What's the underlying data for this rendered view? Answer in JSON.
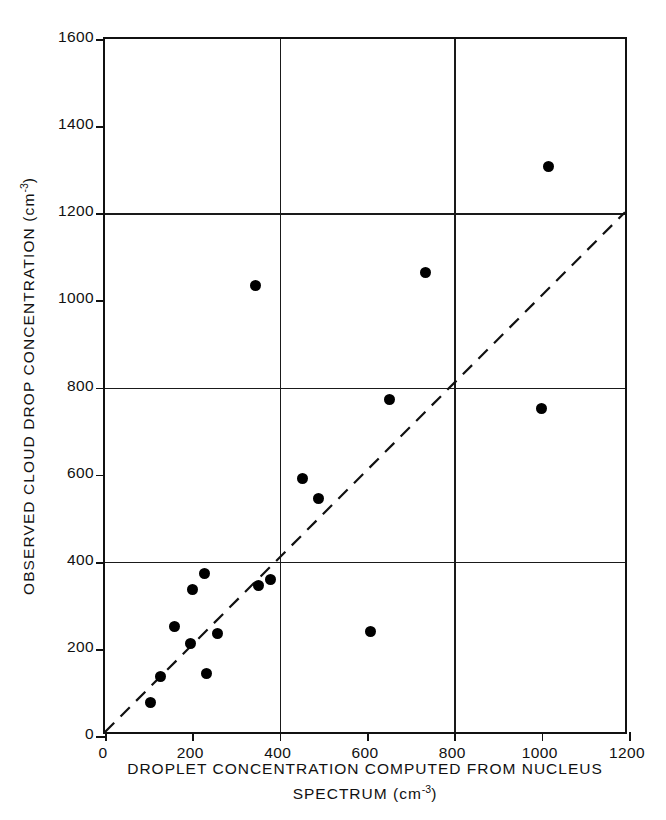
{
  "chart_data": {
    "type": "scatter",
    "title": "",
    "xlabel": "DROPLET CONCENTRATION COMPUTED FROM NUCLEUS SPECTRUM (cm-3)",
    "xlabel_line1": "DROPLET CONCENTRATION COMPUTED FROM NUCLEUS",
    "xlabel_line2_prefix": "SPECTRUM (cm",
    "xlabel_line2_exp": "-3",
    "xlabel_line2_suffix": ")",
    "ylabel": "OBSERVED CLOUD DROP CONCENTRATION (cm-3)",
    "ylabel_prefix": "OBSERVED CLOUD DROP CONCENTRATION (cm",
    "ylabel_exp": "-3",
    "ylabel_suffix": ")",
    "xlim": [
      0,
      1200
    ],
    "ylim": [
      0,
      1600
    ],
    "xticks": [
      0,
      200,
      400,
      600,
      800,
      1000,
      1200
    ],
    "yticks": [
      0,
      200,
      400,
      600,
      800,
      1000,
      1200,
      1400,
      1600
    ],
    "xtick_labels": [
      "0",
      "200",
      "400",
      "600",
      "800",
      "1000",
      "1200"
    ],
    "ytick_labels": [
      "0",
      "200",
      "400",
      "600",
      "800",
      "1000",
      "1200",
      "1400",
      "1600"
    ],
    "grid": true,
    "gridlines_x": [
      400,
      800
    ],
    "gridlines_y": [
      400,
      800,
      1200
    ],
    "legend": null,
    "marker_color": "#000000",
    "axis_color": "#111111",
    "background_color": "#ffffff",
    "points": [
      {
        "x": 105,
        "y": 78
      },
      {
        "x": 128,
        "y": 136
      },
      {
        "x": 160,
        "y": 252
      },
      {
        "x": 196,
        "y": 213
      },
      {
        "x": 200,
        "y": 337
      },
      {
        "x": 228,
        "y": 372
      },
      {
        "x": 232,
        "y": 144
      },
      {
        "x": 258,
        "y": 236
      },
      {
        "x": 345,
        "y": 1033
      },
      {
        "x": 352,
        "y": 345
      },
      {
        "x": 378,
        "y": 360
      },
      {
        "x": 452,
        "y": 590
      },
      {
        "x": 488,
        "y": 545
      },
      {
        "x": 608,
        "y": 241
      },
      {
        "x": 652,
        "y": 772
      },
      {
        "x": 735,
        "y": 1065
      },
      {
        "x": 1000,
        "y": 752
      },
      {
        "x": 1015,
        "y": 1308
      }
    ],
    "reference_line": {
      "style": "dashed",
      "description": "1:1 line",
      "from": {
        "x": 0,
        "y": 0
      },
      "to": {
        "x": 1200,
        "y": 1200
      }
    }
  }
}
